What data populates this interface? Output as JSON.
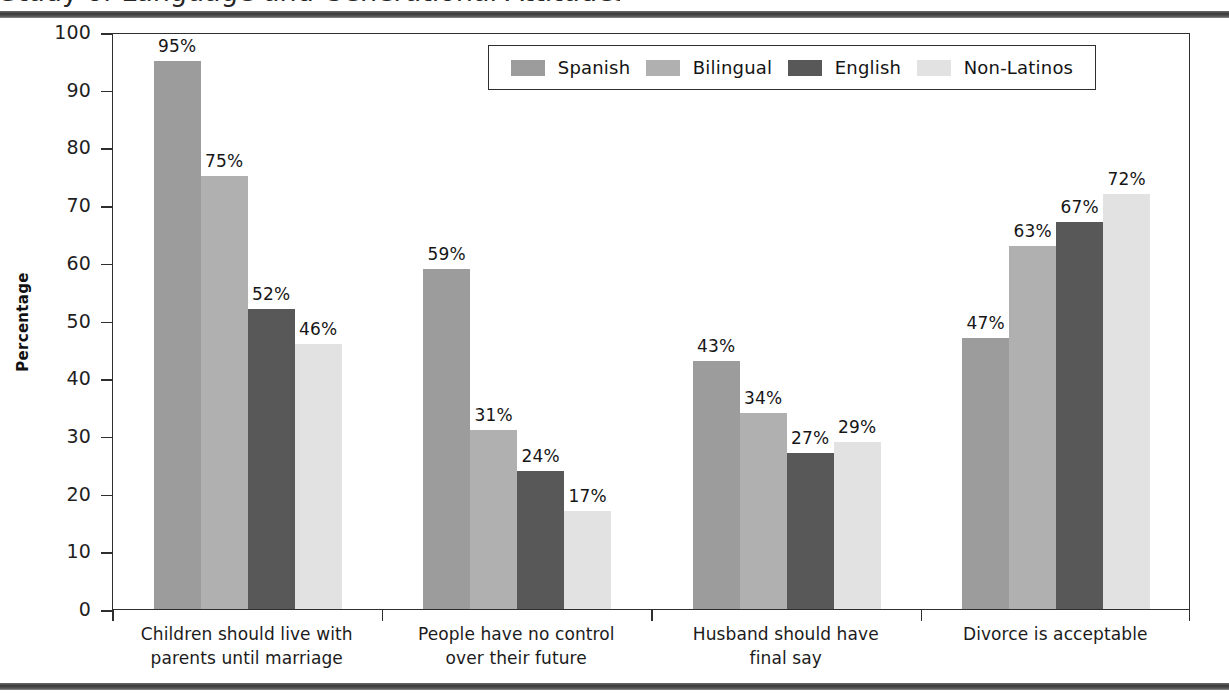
{
  "page": {
    "clipped_heading": "Study of Language and Generational Attitudes",
    "top_rule_color": "#3f3f3f",
    "bottom_rule_color": "#3f3f3f"
  },
  "chart_data": {
    "type": "bar",
    "title": "",
    "xlabel": "",
    "ylabel": "Percentage",
    "ylim": [
      0,
      100
    ],
    "yticks": [
      0,
      10,
      20,
      30,
      40,
      50,
      60,
      70,
      80,
      90,
      100
    ],
    "ytick_labels": [
      "0",
      "10",
      "20",
      "30",
      "40",
      "50",
      "60",
      "70",
      "80",
      "90",
      "100"
    ],
    "grid": false,
    "legend_position": "top-right-inside",
    "value_suffix": "%",
    "categories": [
      "Children should live with\nparents until marriage",
      "People have no control\nover their future",
      "Husband should have\nfinal say",
      "Divorce is acceptable"
    ],
    "series": [
      {
        "name": "Spanish",
        "color": "#9c9c9c",
        "values": [
          95,
          59,
          43,
          47
        ],
        "labels": [
          "95%",
          "59%",
          "43%",
          "47%"
        ]
      },
      {
        "name": "Bilingual",
        "color": "#b0b0b0",
        "values": [
          75,
          31,
          34,
          63
        ],
        "labels": [
          "75%",
          "31%",
          "34%",
          "63%"
        ]
      },
      {
        "name": "English",
        "color": "#585858",
        "values": [
          52,
          24,
          27,
          67
        ],
        "labels": [
          "52%",
          "24%",
          "27%",
          "67%"
        ]
      },
      {
        "name": "Non-Latinos",
        "color": "#e2e2e2",
        "values": [
          46,
          17,
          29,
          72
        ],
        "labels": [
          "46%",
          "17%",
          "29%",
          "72%"
        ]
      }
    ]
  }
}
